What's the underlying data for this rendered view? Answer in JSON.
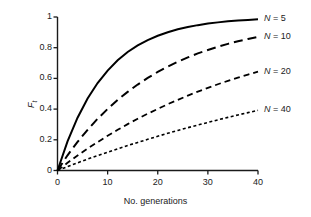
{
  "chart_data": {
    "type": "line",
    "title": "",
    "xlabel": "No. generations",
    "ylabel": "F_t",
    "ylabel_base": "F",
    "ylabel_sub": "t",
    "xlim": [
      0,
      40
    ],
    "ylim": [
      0,
      1
    ],
    "xticks": [
      0,
      10,
      20,
      30,
      40
    ],
    "xtick_labels": [
      "0",
      "10",
      "20",
      "30",
      "40"
    ],
    "yticks": [
      0,
      0.2,
      0.4,
      0.6,
      0.8,
      1
    ],
    "ytick_labels": [
      "0",
      "0.2",
      "0.4",
      "0.6",
      "0.8",
      "1"
    ],
    "grid": false,
    "legend_position": "right-inline-end-of-line",
    "x": [
      0,
      2,
      4,
      6,
      8,
      10,
      12,
      14,
      16,
      18,
      20,
      22,
      24,
      26,
      28,
      30,
      32,
      34,
      36,
      38,
      40
    ],
    "series": [
      {
        "name": "N = 5",
        "label_prefix": "N",
        "label_suffix": "= 5",
        "population_size": 5,
        "linestyle": "solid",
        "dasharray": "",
        "linewidth": 2.0,
        "color": "#000000",
        "values": [
          0,
          0.19,
          0.344,
          0.469,
          0.57,
          0.651,
          0.718,
          0.772,
          0.815,
          0.85,
          0.878,
          0.901,
          0.92,
          0.935,
          0.947,
          0.957,
          0.965,
          0.972,
          0.977,
          0.981,
          0.985
        ],
        "end_value": 0.985
      },
      {
        "name": "N = 10",
        "label_prefix": "N",
        "label_suffix": "= 10",
        "population_size": 10,
        "linestyle": "long-dash",
        "dasharray": "9 5",
        "linewidth": 2.0,
        "color": "#000000",
        "values": [
          0,
          0.099,
          0.186,
          0.265,
          0.337,
          0.401,
          0.46,
          0.512,
          0.56,
          0.603,
          0.642,
          0.677,
          0.708,
          0.737,
          0.763,
          0.785,
          0.806,
          0.825,
          0.842,
          0.857,
          0.871
        ],
        "end_value": 0.871
      },
      {
        "name": "N = 20",
        "label_prefix": "N",
        "label_suffix": "= 20",
        "population_size": 20,
        "linestyle": "medium-dash",
        "dasharray": "6 4",
        "linewidth": 1.8,
        "color": "#000000",
        "values": [
          0,
          0.05,
          0.098,
          0.143,
          0.185,
          0.226,
          0.265,
          0.302,
          0.337,
          0.37,
          0.401,
          0.432,
          0.46,
          0.488,
          0.514,
          0.538,
          0.562,
          0.584,
          0.605,
          0.625,
          0.644
        ],
        "end_value": 0.644
      },
      {
        "name": "N = 40",
        "label_prefix": "N",
        "label_suffix": "= 40",
        "population_size": 40,
        "linestyle": "short-dash",
        "dasharray": "3 2.5",
        "linewidth": 1.6,
        "color": "#000000",
        "values": [
          0,
          0.025,
          0.05,
          0.074,
          0.097,
          0.119,
          0.141,
          0.163,
          0.183,
          0.203,
          0.223,
          0.242,
          0.261,
          0.279,
          0.296,
          0.313,
          0.33,
          0.346,
          0.362,
          0.377,
          0.392
        ],
        "end_value": 0.392
      }
    ]
  },
  "axes": {
    "x_title": "No. generations",
    "y_title_base": "F",
    "y_title_sub": "t",
    "x_tick_labels": [
      "0",
      "10",
      "20",
      "30",
      "40"
    ],
    "y_tick_labels": [
      "1",
      "0.8",
      "0.6",
      "0.4",
      "0.2",
      "0"
    ]
  },
  "legend": {
    "items": [
      {
        "var": "N",
        "rest": "= 5"
      },
      {
        "var": "N",
        "rest": "= 10"
      },
      {
        "var": "N",
        "rest": "= 20"
      },
      {
        "var": "N",
        "rest": "= 40"
      }
    ]
  },
  "style": {
    "axis_color": "#1a1a1a",
    "line_color": "#000000",
    "background": "#ffffff",
    "text_color": "#222222"
  }
}
